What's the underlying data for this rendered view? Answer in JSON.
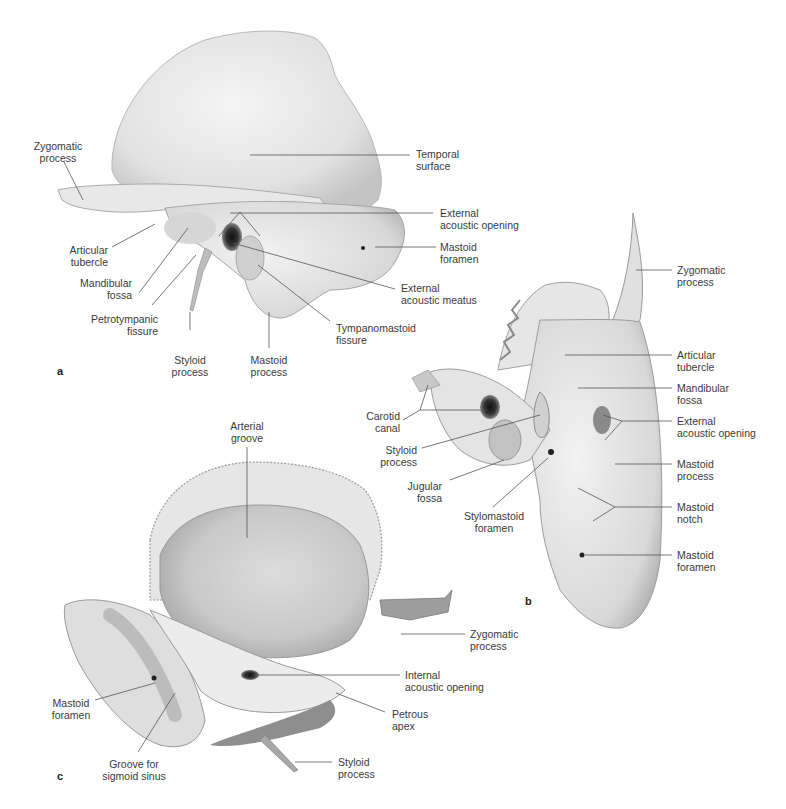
{
  "figure": {
    "panels": [
      {
        "id": "a",
        "label": "a",
        "labels": [
          {
            "key": "zygomatic_process",
            "text": "Zygomatic\nprocess"
          },
          {
            "key": "temporal_surface",
            "text": "Temporal\nsurface"
          },
          {
            "key": "external_acoustic_opening",
            "text": "External\nacoustic opening"
          },
          {
            "key": "articular_tubercle",
            "text": "Articular\ntubercle"
          },
          {
            "key": "mastoid_foramen",
            "text": "Mastoid\nforamen"
          },
          {
            "key": "mandibular_fossa",
            "text": "Mandibular\nfossa"
          },
          {
            "key": "external_acoustic_meatus",
            "text": "External\nacoustic meatus"
          },
          {
            "key": "petrotympanic_fissure",
            "text": "Petrotympanic\nfissure"
          },
          {
            "key": "tympanomastoid_fissure",
            "text": "Tympanomastoid\nfissure"
          },
          {
            "key": "styloid_process",
            "text": "Styloid\nprocess"
          },
          {
            "key": "mastoid_process",
            "text": "Mastoid\nprocess"
          }
        ]
      },
      {
        "id": "b",
        "label": "b",
        "labels": [
          {
            "key": "zygomatic_process",
            "text": "Zygomatic\nprocess"
          },
          {
            "key": "articular_tubercle",
            "text": "Articular\ntubercle"
          },
          {
            "key": "mandibular_fossa",
            "text": "Mandibular\nfossa"
          },
          {
            "key": "carotid_canal",
            "text": "Carotid\ncanal"
          },
          {
            "key": "external_acoustic_opening",
            "text": "External\nacoustic opening"
          },
          {
            "key": "styloid_process",
            "text": "Styloid\nprocess"
          },
          {
            "key": "mastoid_process",
            "text": "Mastoid\nprocess"
          },
          {
            "key": "jugular_fossa",
            "text": "Jugular\nfossa"
          },
          {
            "key": "mastoid_notch",
            "text": "Mastoid\nnotch"
          },
          {
            "key": "stylomastoid_foramen",
            "text": "Stylomastoid\nforamen"
          },
          {
            "key": "mastoid_foramen",
            "text": "Mastoid\nforamen"
          }
        ]
      },
      {
        "id": "c",
        "label": "c",
        "labels": [
          {
            "key": "arterial_groove",
            "text": "Arterial\ngroove"
          },
          {
            "key": "zygomatic_process",
            "text": "Zygomatic\nprocess"
          },
          {
            "key": "internal_acoustic_opening",
            "text": "Internal\nacoustic opening"
          },
          {
            "key": "mastoid_foramen",
            "text": "Mastoid\nforamen"
          },
          {
            "key": "petrous_apex",
            "text": "Petrous\napex"
          },
          {
            "key": "groove_for_sigmoid_sinus",
            "text": "Groove for\nsigmoid sinus"
          },
          {
            "key": "styloid_process",
            "text": "Styloid\nprocess"
          }
        ]
      }
    ],
    "colors": {
      "background": "#ffffff",
      "bone_light": "#ececec",
      "bone_mid": "#d2d2d2",
      "bone_dark": "#9a9a9a",
      "leader_line": "#555555",
      "text": "#3a3a3a"
    }
  }
}
